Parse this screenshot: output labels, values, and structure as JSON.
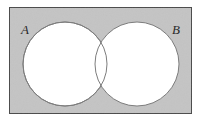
{
  "figure": {
    "background_color": "#ffffff"
  },
  "universe_rect": {
    "name": "universal-set-rectangle",
    "x": 9.5,
    "y": 7.5,
    "width": 182,
    "height": 106,
    "fill": "#c4c4c4",
    "stroke": "#4a4a4a",
    "stroke_width": 1
  },
  "circles": [
    {
      "label": "A",
      "name": "set-a-circle",
      "cx": 65,
      "cy": 64,
      "r": 42,
      "fill": "#ffffff",
      "stroke": "#7d7d7d",
      "stroke_width": 1
    },
    {
      "label": "B",
      "name": "set-b-circle",
      "cx": 137,
      "cy": 64,
      "r": 42,
      "fill": "#ffffff",
      "stroke": "#7d7d7d",
      "stroke_width": 1
    }
  ],
  "labels": {
    "set_a": "A",
    "set_b": "B",
    "set_a_x": 21,
    "set_a_y": 34,
    "set_b_x": 172,
    "set_b_y": 34,
    "font_size": 13,
    "color": "#2a2a2a"
  },
  "chart_data": {
    "type": "venn",
    "sets": [
      "A",
      "B"
    ],
    "set_labels": [
      "A",
      "B"
    ],
    "regions": [
      {
        "id": "A_only",
        "label": "A \\ B",
        "filled": true,
        "fill": "#ffffff"
      },
      {
        "id": "B_only",
        "label": "B \\ A",
        "filled": true,
        "fill": "#ffffff"
      },
      {
        "id": "A_and_B",
        "label": "A ∩ B",
        "filled": true,
        "fill": "#ffffff"
      },
      {
        "id": "outside_both",
        "label": "(A ∪ B)'",
        "filled": true,
        "fill": "#c4c4c4"
      }
    ],
    "shaded_region": "outside_both",
    "shading_color": "#c4c4c4",
    "unshaded_color": "#ffffff",
    "universe_shown": true,
    "universe_shape": "rectangle",
    "overlap": true,
    "legend": "none",
    "grid": false
  }
}
